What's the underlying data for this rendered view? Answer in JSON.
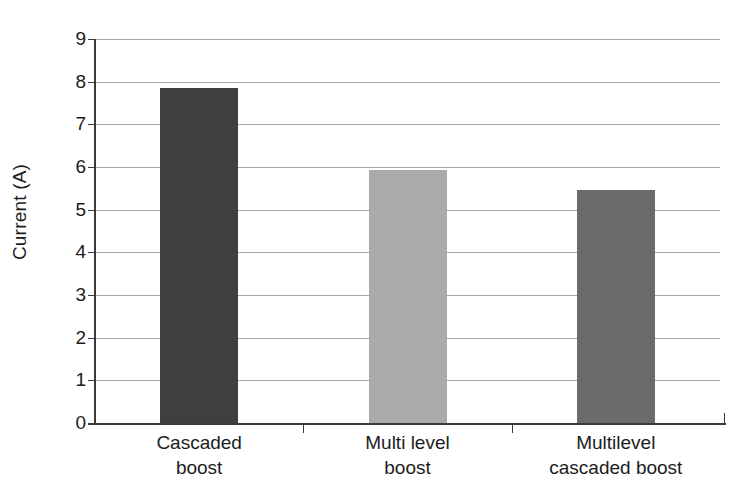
{
  "chart_data": {
    "type": "bar",
    "title": "",
    "xlabel": "",
    "ylabel": "Current (A)",
    "ylim": [
      0,
      9
    ],
    "ytick_step": 1,
    "grid": true,
    "legend": "none",
    "categories": [
      "Cascaded boost",
      "Multi level boost",
      "Multilevel cascaded boost"
    ],
    "category_lines": [
      [
        "Cascaded",
        "boost"
      ],
      [
        "Multi level",
        "boost"
      ],
      [
        "Multilevel",
        "cascaded boost"
      ]
    ],
    "values": [
      7.85,
      5.92,
      5.47
    ],
    "bar_colors": [
      "#3f3f3f",
      "#aaaaaa",
      "#6b6b6b"
    ],
    "ytick_labels": [
      "9",
      "8",
      "7",
      "6",
      "5",
      "4",
      "3",
      "2",
      "1",
      "0"
    ],
    "ytick_values": [
      9,
      8,
      7,
      6,
      5,
      4,
      3,
      2,
      1,
      0
    ]
  },
  "colors": {
    "background": "#ffffff",
    "gridline": "#a6a6a6",
    "axis": "#3a3a3a",
    "text": "#1c1c1c"
  }
}
